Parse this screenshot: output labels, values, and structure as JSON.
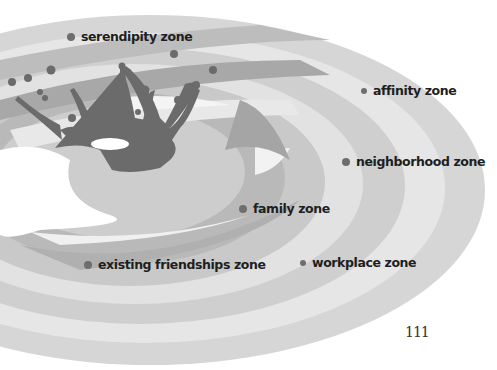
{
  "figure": {
    "colors": {
      "background": "#ffffff",
      "ring_outer": "#d8d8d8",
      "ring_light": "#e9e9e9",
      "ring_mid": "#c4c4c4",
      "ring_dark": "#a9a9a9",
      "splash": "#6b6b6b",
      "dot": "#6e6e6e",
      "text": "#1e1e1e"
    },
    "zones": [
      {
        "id": "serendipity",
        "label": "serendipity zone"
      },
      {
        "id": "affinity",
        "label": "affinity zone"
      },
      {
        "id": "neighborhood",
        "label": "neighborhood zone"
      },
      {
        "id": "family",
        "label": "family zone"
      },
      {
        "id": "existing-friendships",
        "label": "existing friendships zone"
      },
      {
        "id": "workplace",
        "label": "workplace zone"
      }
    ]
  },
  "page": {
    "number": "111"
  }
}
